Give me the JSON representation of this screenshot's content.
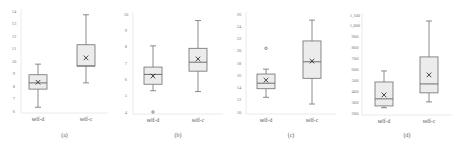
{
  "chart_data": [
    {
      "type": "box",
      "caption": "(a)",
      "title": "",
      "xlabel": "",
      "ylabel": "",
      "ylim": [
        6,
        14
      ],
      "yticks": [
        "6",
        "7",
        "8",
        "9",
        "10",
        "11",
        "12",
        "13",
        "14"
      ],
      "yticks_values": [
        6,
        7,
        8,
        9,
        10,
        11,
        12,
        13,
        14
      ],
      "categories": [
        "self-d",
        "self-c"
      ],
      "boxes": [
        {
          "name": "self-d",
          "min": 6.3,
          "q1": 7.75,
          "median": 8.25,
          "q3": 8.9,
          "max": 9.75,
          "mean": 8.3,
          "outliers": []
        },
        {
          "name": "self-c",
          "min": 8.25,
          "q1": 9.6,
          "median": 9.6,
          "q3": 11.3,
          "max": 13.7,
          "mean": 10.25,
          "outliers": []
        }
      ],
      "grid": false
    },
    {
      "type": "box",
      "caption": "(b)",
      "title": "",
      "xlabel": "",
      "ylabel": "",
      "ylim": [
        4,
        10
      ],
      "yticks": [
        "4",
        "5",
        "6",
        "7",
        "8",
        "9",
        "10"
      ],
      "yticks_values": [
        4,
        5,
        6,
        7,
        8,
        9,
        10
      ],
      "categories": [
        "self-d",
        "self-c"
      ],
      "boxes": [
        {
          "name": "self-d",
          "min": 5.3,
          "q1": 5.7,
          "median": 6.3,
          "q3": 6.75,
          "max": 8.05,
          "mean": 6.2,
          "outliers": [
            4.0
          ]
        },
        {
          "name": "self-c",
          "min": 5.25,
          "q1": 6.5,
          "median": 7.05,
          "q3": 7.9,
          "max": 9.6,
          "mean": 7.25,
          "outliers": []
        }
      ],
      "grid": false
    },
    {
      "type": "box",
      "caption": "(c)",
      "title": "",
      "xlabel": "",
      "ylabel": "",
      "ylim": [
        10,
        26
      ],
      "yticks": [
        "10",
        "12",
        "14",
        "16",
        "18",
        "20",
        "22",
        "24",
        "26"
      ],
      "yticks_values": [
        10,
        12,
        14,
        16,
        18,
        20,
        22,
        24,
        26
      ],
      "categories": [
        "self-d",
        "self-c"
      ],
      "boxes": [
        {
          "name": "self-d",
          "min": 12.4,
          "q1": 13.8,
          "median": 14.7,
          "q3": 16.2,
          "max": 17.0,
          "mean": 15.2,
          "outliers": [
            20.4
          ]
        },
        {
          "name": "self-c",
          "min": 11.3,
          "q1": 15.5,
          "median": 18.2,
          "q3": 21.6,
          "max": 25.0,
          "mean": 18.3,
          "outliers": []
        }
      ],
      "grid": false
    },
    {
      "type": "box",
      "caption": "(d)",
      "title": "",
      "xlabel": "",
      "ylabel": "",
      "ylim": [
        200,
        1100
      ],
      "yticks": [
        "200",
        "300",
        "400",
        "500",
        "600",
        "700",
        "800",
        "900",
        "1,000",
        "1,100"
      ],
      "yticks_values": [
        200,
        300,
        400,
        500,
        600,
        700,
        800,
        900,
        1000,
        1100
      ],
      "categories": [
        "self-d",
        "self-c"
      ],
      "boxes": [
        {
          "name": "self-d",
          "min": 248,
          "q1": 265,
          "median": 330,
          "q3": 485,
          "max": 586,
          "mean": 366,
          "outliers": []
        },
        {
          "name": "self-c",
          "min": 302,
          "q1": 385,
          "median": 467,
          "q3": 715,
          "max": 1045,
          "mean": 550,
          "outliers": []
        }
      ],
      "grid": false
    }
  ],
  "style": {
    "box_fill": "#ececec",
    "box_stroke": "#6e6e6e",
    "whisker_stroke": "#6e6e6e",
    "mean_marker_color": "#333333",
    "axis_color": "#e4e4e4"
  },
  "panels_layout": [
    {
      "x": 0,
      "plotLeft": 21,
      "plotRight": 108,
      "plotTop": 11,
      "plotBottom": 111,
      "catX": [
        38,
        86
      ],
      "labelX": 14
    },
    {
      "x": 114,
      "plotLeft": 133,
      "plotRight": 223,
      "plotTop": 14,
      "plotBottom": 112,
      "catX": [
        153,
        198
      ],
      "labelX": 126
    },
    {
      "x": 227,
      "plotLeft": 246,
      "plotRight": 336,
      "plotTop": 14,
      "plotBottom": 112,
      "catX": [
        266,
        312
      ],
      "labelX": 239
    },
    {
      "x": 340,
      "plotLeft": 362,
      "plotRight": 452,
      "plotTop": 15,
      "plotBottom": 113,
      "catX": [
        384,
        429
      ],
      "labelX": 355
    }
  ]
}
